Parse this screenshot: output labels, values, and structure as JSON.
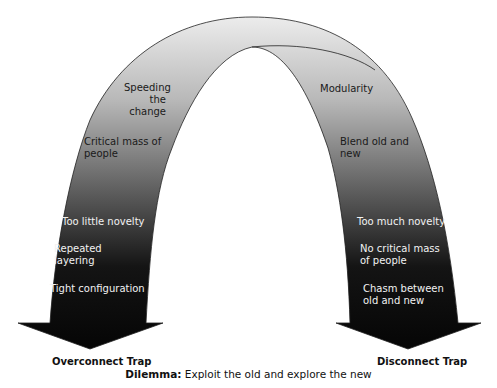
{
  "diagram": {
    "type": "arch-with-two-arrows",
    "left_arm_labels": {
      "speeding": "Speeding\nthe change",
      "critical_mass": "Critical mass of\npeople",
      "too_little": "Too little novelty",
      "repeated": "Repeated\nlayering",
      "tight": "Tight configuration"
    },
    "right_arm_labels": {
      "modularity": "Modularity",
      "blend": "Blend old and\nnew",
      "too_much": "Too much novelty",
      "no_critical": "No critical mass\nof people",
      "chasm": "Chasm between\nold and new"
    },
    "left_trap": "Overconnect Trap",
    "right_trap": "Disconnect Trap",
    "caption": {
      "bold": "Dilemma:",
      "text": "Exploit the old and explore the new"
    },
    "colors": {
      "gradient_top": "#e6e6e6",
      "gradient_bottom": "#0a0a0a",
      "outline": "#222222",
      "background": "#ffffff"
    }
  }
}
